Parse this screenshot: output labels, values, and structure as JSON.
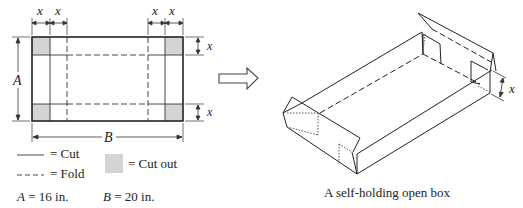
{
  "flat_pattern": {
    "dimension_labels": {
      "x": "x",
      "A": "A",
      "B": "B"
    },
    "cutout_color": "#d4d4d4"
  },
  "legend": {
    "cut_label": "= Cut",
    "fold_label": "= Fold",
    "cutout_label": "= Cut out",
    "a_value": "A = 16 in.",
    "b_value": "B = 20 in.",
    "a_var": "A",
    "a_rest": " = 16 in.",
    "b_var": "B",
    "b_rest": " = 20 in."
  },
  "arrow": {
    "icon": "hollow-right-arrow"
  },
  "box": {
    "dimension_label": "x",
    "caption": "A self-holding open box"
  }
}
